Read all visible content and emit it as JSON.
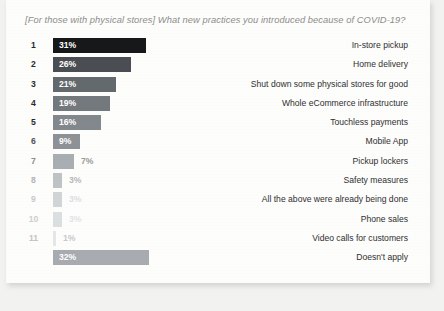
{
  "card": {
    "title": "[For those with physical stores] What new practices you introduced because of COVID-19?"
  },
  "chart_data": {
    "type": "bar",
    "orientation": "horizontal",
    "title": "[For those with physical stores] What new practices you introduced because of COVID-19?",
    "xlabel": "",
    "ylabel": "",
    "xlim": [
      0,
      32
    ],
    "grid": false,
    "legend": false,
    "value_suffix": "%",
    "categories": [
      "In-store pickup",
      "Home delivery",
      "Shut down some physical stores for good",
      "Whole eCommerce infrastructure",
      "Touchless payments",
      "Mobile App",
      "Pickup lockers",
      "Safety measures",
      "All the above were already being done",
      "Phone sales",
      "Video calls for customers",
      "Doesn't apply"
    ],
    "values": [
      31,
      26,
      21,
      19,
      16,
      9,
      7,
      3,
      3,
      3,
      1,
      32
    ],
    "value_labels": [
      "31%",
      "26%",
      "21%",
      "19%",
      "16%",
      "9%",
      "7%",
      "3%",
      "3%",
      "3%",
      "1%",
      "32%"
    ],
    "ranks": [
      "1",
      "2",
      "3",
      "4",
      "5",
      "6",
      "7",
      "8",
      "9",
      "10",
      "11",
      ""
    ],
    "bar_colors": [
      "#16181a",
      "#4a4e52",
      "#64696d",
      "#74797d",
      "#83888c",
      "#8e9296",
      "#a9aeb2",
      "#bfc3c6",
      "#d2d5d8",
      "#dcdfe1",
      "#e4e6e8",
      "#a8acb0"
    ],
    "label_colors": [
      "#ffffff",
      "#ffffff",
      "#ffffff",
      "#ffffff",
      "#ffffff",
      "#ffffff",
      "#9c9b99",
      "#b6b9bb",
      "#dcdfe1",
      "#e2e4e6",
      "#c8cacc",
      "#ffffff"
    ],
    "rank_colors": [
      "#2a2a2a",
      "#2a2a2a",
      "#2a2a2a",
      "#2a2a2a",
      "#2a2a2a",
      "#515151",
      "#8b8b8b",
      "#b4b4b4",
      "#c9c9c9",
      "#cfcfcf",
      "#c4c4c4",
      ""
    ],
    "label_inside": [
      true,
      true,
      true,
      true,
      true,
      true,
      false,
      false,
      false,
      false,
      false,
      true
    ]
  }
}
